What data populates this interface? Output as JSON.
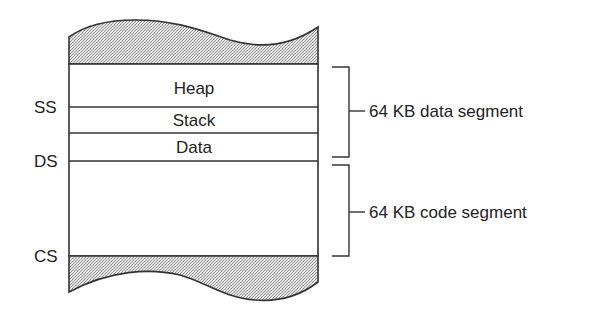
{
  "diagram": {
    "regions": [
      {
        "label": "Heap"
      },
      {
        "label": "Stack"
      },
      {
        "label": "Data"
      }
    ],
    "registers": [
      {
        "label": "SS"
      },
      {
        "label": "DS"
      },
      {
        "label": "CS"
      }
    ],
    "brackets": [
      {
        "label": "64 KB data segment"
      },
      {
        "label": "64 KB code segment"
      }
    ],
    "colors": {
      "line": "#333333",
      "fill_pattern": "#b8b8b8"
    }
  }
}
